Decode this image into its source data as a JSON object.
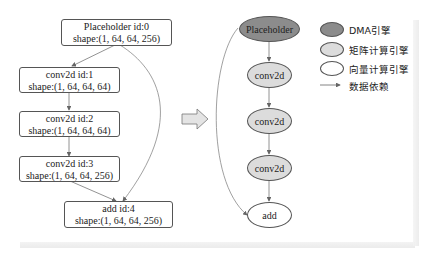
{
  "colors": {
    "dma": "#8c8c8c",
    "matrix": "#dcdcdc",
    "vector": "#ffffff",
    "stroke": "#555555",
    "edge": "#666666"
  },
  "left_graph": {
    "nodes": [
      {
        "id": 0,
        "title": "Placeholder id:0",
        "shape": "shape:(1, 64, 64, 256)"
      },
      {
        "id": 1,
        "title": "conv2d id:1",
        "shape": "shape:(1, 64, 64, 64)"
      },
      {
        "id": 2,
        "title": "conv2d id:2",
        "shape": "shape:(1, 64, 64, 64)"
      },
      {
        "id": 3,
        "title": "conv2d id:3",
        "shape": "shape:(1, 64, 64, 256)"
      },
      {
        "id": 4,
        "title": "add id:4",
        "shape": "shape:(1, 64, 64, 256)"
      }
    ],
    "edges": [
      [
        0,
        1
      ],
      [
        1,
        2
      ],
      [
        2,
        3
      ],
      [
        3,
        4
      ],
      [
        0,
        4
      ]
    ]
  },
  "transform_arrow": "hollow-right-arrow",
  "right_graph": {
    "nodes": [
      {
        "label": "Placeholder",
        "engine": "dma"
      },
      {
        "label": "conv2d",
        "engine": "matrix"
      },
      {
        "label": "conv2d",
        "engine": "matrix"
      },
      {
        "label": "conv2d",
        "engine": "matrix"
      },
      {
        "label": "add",
        "engine": "vector"
      }
    ],
    "edges": [
      [
        0,
        1
      ],
      [
        1,
        2
      ],
      [
        2,
        3
      ],
      [
        3,
        4
      ],
      [
        0,
        4
      ]
    ]
  },
  "legend": {
    "items": [
      {
        "label": "DMA引擎",
        "type": "ellipse",
        "engine": "dma"
      },
      {
        "label": "矩阵计算引擎",
        "type": "ellipse",
        "engine": "matrix"
      },
      {
        "label": "向量计算引擎",
        "type": "ellipse",
        "engine": "vector"
      },
      {
        "label": "数据依赖",
        "type": "arrow"
      }
    ]
  }
}
